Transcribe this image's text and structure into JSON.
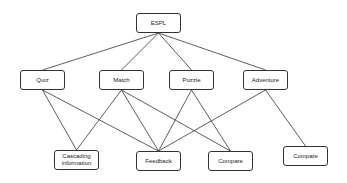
{
  "diagram": {
    "nodes": [
      {
        "id": "espl",
        "label": "ESPL"
      },
      {
        "id": "quiz",
        "label": "Quiz"
      },
      {
        "id": "match",
        "label": "Match"
      },
      {
        "id": "puzzle",
        "label": "Puzzle"
      },
      {
        "id": "adventure",
        "label": "Adventure"
      },
      {
        "id": "cascading",
        "label": "Cascading\ninformation"
      },
      {
        "id": "feedback",
        "label": "Feedback"
      },
      {
        "id": "compare1",
        "label": "Compare"
      },
      {
        "id": "compare2",
        "label": "Compare"
      }
    ],
    "edges": [
      {
        "from": "espl",
        "to": "quiz"
      },
      {
        "from": "espl",
        "to": "match"
      },
      {
        "from": "espl",
        "to": "puzzle"
      },
      {
        "from": "espl",
        "to": "adventure"
      },
      {
        "from": "quiz",
        "to": "cascading"
      },
      {
        "from": "quiz",
        "to": "feedback"
      },
      {
        "from": "match",
        "to": "cascading"
      },
      {
        "from": "match",
        "to": "feedback"
      },
      {
        "from": "match",
        "to": "compare1"
      },
      {
        "from": "puzzle",
        "to": "feedback"
      },
      {
        "from": "puzzle",
        "to": "compare1"
      },
      {
        "from": "adventure",
        "to": "feedback"
      },
      {
        "from": "adventure",
        "to": "compare2"
      }
    ],
    "colors": {
      "stroke": "#333333",
      "text": "#222222",
      "background": "#ffffff"
    }
  }
}
